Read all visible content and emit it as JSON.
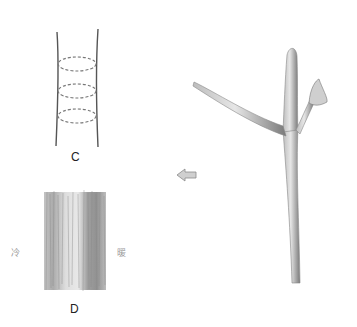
{
  "figure": {
    "panel_c": {
      "label": "C",
      "ellipse_count": 3
    },
    "panel_d": {
      "label": "D",
      "left_label": "冷",
      "right_label": "暖"
    },
    "arrow": {
      "direction": "left",
      "icon": "left-arrow-icon"
    },
    "branch": {
      "description": "pencil-sketched twig with forked branches and bud"
    }
  },
  "colors": {
    "ink": "#555555",
    "shade_dark": "#6e6e6e",
    "shade_light": "#c8c8c8",
    "dashed": "#777777"
  }
}
